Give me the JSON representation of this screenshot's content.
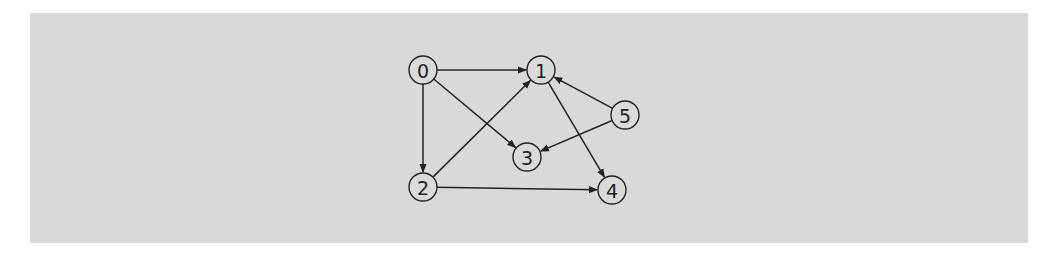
{
  "diagram": {
    "type": "directed-graph",
    "background": "#d9d9d9",
    "node_radius": 14,
    "nodes": [
      {
        "id": "0",
        "label": "0",
        "x": 423,
        "y": 70
      },
      {
        "id": "1",
        "label": "1",
        "x": 541,
        "y": 70
      },
      {
        "id": "2",
        "label": "2",
        "x": 423,
        "y": 187
      },
      {
        "id": "3",
        "label": "3",
        "x": 527,
        "y": 157
      },
      {
        "id": "4",
        "label": "4",
        "x": 612,
        "y": 190
      },
      {
        "id": "5",
        "label": "5",
        "x": 625,
        "y": 115
      }
    ],
    "edges": [
      {
        "from": "0",
        "to": "1"
      },
      {
        "from": "0",
        "to": "2"
      },
      {
        "from": "0",
        "to": "3"
      },
      {
        "from": "2",
        "to": "1"
      },
      {
        "from": "2",
        "to": "4"
      },
      {
        "from": "1",
        "to": "4"
      },
      {
        "from": "5",
        "to": "1"
      },
      {
        "from": "5",
        "to": "3"
      }
    ]
  }
}
